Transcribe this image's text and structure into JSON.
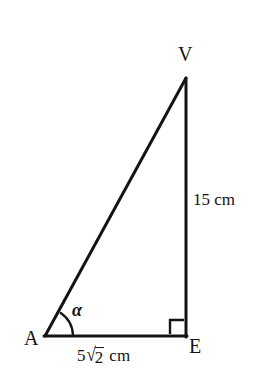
{
  "figure": {
    "kind": "right-triangle-diagram",
    "background_color": "#ffffff",
    "stroke_color": "#141414",
    "stroke_width": 3,
    "canvas": {
      "width": 258,
      "height": 388
    },
    "vertices": {
      "A": {
        "label": "A",
        "x": 45,
        "y": 336
      },
      "E": {
        "label": "E",
        "x": 186,
        "y": 336
      },
      "V": {
        "label": "V",
        "x": 186,
        "y": 78
      }
    },
    "sides": {
      "vertical": {
        "from": "V",
        "to": "E",
        "length_label": "15 cm",
        "value": 15,
        "unit": "cm"
      },
      "base": {
        "from": "A",
        "to": "E",
        "length_label": "5√2 cm",
        "coefficient": "5",
        "radical_sign": "√",
        "radicand": "2",
        "unit": "cm"
      },
      "hypotenuse": {
        "from": "A",
        "to": "V"
      }
    },
    "angles": {
      "at_A": {
        "symbol": "α",
        "arc_radius": 28
      },
      "at_E": {
        "marker": "right-angle-square",
        "size": 14
      }
    }
  }
}
